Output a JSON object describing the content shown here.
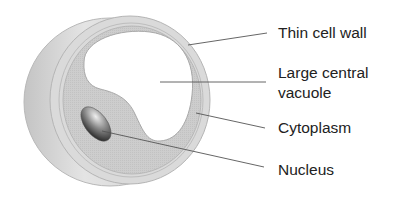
{
  "diagram": {
    "labels": {
      "cell_wall": "Thin cell wall",
      "vacuole_line1": "Large central",
      "vacuole_line2": "vacuole",
      "cytoplasm": "Cytoplasm",
      "nucleus": "Nucleus"
    },
    "colors": {
      "wall": "#d4d4d4",
      "cytoplasm": "#c9c9c9",
      "vacuole": "#ffffff",
      "nucleus_light": "#e6e6e6",
      "nucleus_dark": "#1e1e1e",
      "leader_line": "#555555",
      "text": "#222222"
    }
  }
}
